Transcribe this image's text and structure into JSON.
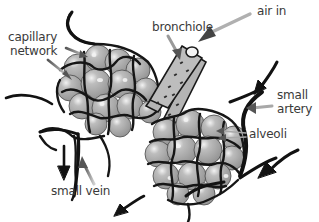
{
  "diagram": {
    "colors": {
      "alveolus_fill": "#a9a9a9",
      "alveolus_highlight": "#e6e6e6",
      "vessel": "#1a1a1a",
      "bronchiole_fill": "#b4b4b4",
      "pointer_arrow": "#8a8a8a",
      "text": "#3a3a3a",
      "background": "#ffffff"
    },
    "labels": {
      "capillary_network_line1": "capillary",
      "capillary_network_line2": "network",
      "bronchiole": "bronchiole",
      "air_in": "air in",
      "small_artery_line1": "small",
      "small_artery_line2": "artery",
      "alveoli": "alveoli",
      "small_vein": "small vein"
    },
    "flow_arrows": [
      {
        "name": "air-in-arrow",
        "direction": "down-left"
      },
      {
        "name": "artery-flow-arrow",
        "direction": "down-left"
      },
      {
        "name": "lower-right-flow-arrow",
        "direction": "down-left"
      },
      {
        "name": "bottom-flow-arrow",
        "direction": "down-left"
      },
      {
        "name": "left-vein-flow-arrow",
        "direction": "down"
      }
    ]
  }
}
